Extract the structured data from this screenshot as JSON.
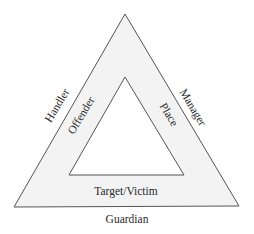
{
  "diagram": {
    "type": "nested-triangle",
    "colors": {
      "background": "#ffffff",
      "band_fill": "#f3f3f3",
      "inner_fill": "#ffffff",
      "stroke": "#555555",
      "text": "#2a2a2a"
    },
    "outer_labels": {
      "left": "Handler",
      "right": "Manager",
      "bottom": "Guardian"
    },
    "inner_labels": {
      "left": "Offender",
      "right": "Place",
      "bottom": "Target/Victim"
    }
  }
}
